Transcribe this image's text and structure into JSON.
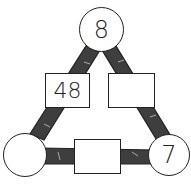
{
  "diagram": {
    "type": "multiplication-triangle",
    "circles": {
      "top": "8",
      "bottom_left": "",
      "bottom_right": "7"
    },
    "boxes": {
      "left": "48",
      "right": "",
      "bottom": ""
    },
    "colors": {
      "band": "#3a3a3a",
      "stroke": "#222222",
      "fill": "#ffffff"
    }
  }
}
